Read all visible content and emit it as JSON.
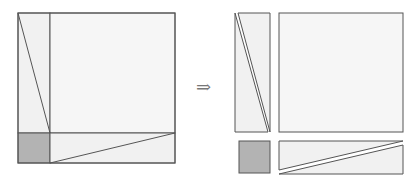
{
  "diagram": {
    "arrow_symbol": "⇒",
    "colors": {
      "stroke": "#555555",
      "light_fill": "#f1f1f1",
      "square_fill": "#f6f6f6",
      "shaded_fill": "#b3b3b3"
    },
    "left_figure": {
      "outer_square": [
        18,
        13,
        175,
        163
      ],
      "vertical_divider_x": 50,
      "horizontal_divider_y": 133,
      "left_diagonal": [
        [
          18,
          13
        ],
        [
          50,
          133
        ]
      ],
      "bottom_diagonal": [
        [
          50,
          163
        ],
        [
          175,
          133
        ]
      ]
    },
    "right_figure": {
      "tall_rect": [
        235,
        13,
        270,
        132
      ],
      "big_square": [
        279,
        13,
        403,
        132
      ],
      "shaded_square": [
        239,
        141,
        270,
        173
      ],
      "wide_rect": [
        279,
        141,
        403,
        174
      ]
    }
  }
}
